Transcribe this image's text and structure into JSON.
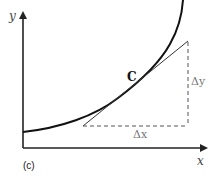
{
  "figure": {
    "panel_label": "(c)",
    "axes": {
      "x_label": "x",
      "y_label": "y"
    },
    "point_label": "C",
    "delta_x_label": "Δx",
    "delta_y_label": "Δy",
    "colors": {
      "curve": "#111111",
      "axes": "#222222",
      "tangent": "#333333",
      "dashed": "#555555",
      "label_grey": "#777777"
    }
  }
}
